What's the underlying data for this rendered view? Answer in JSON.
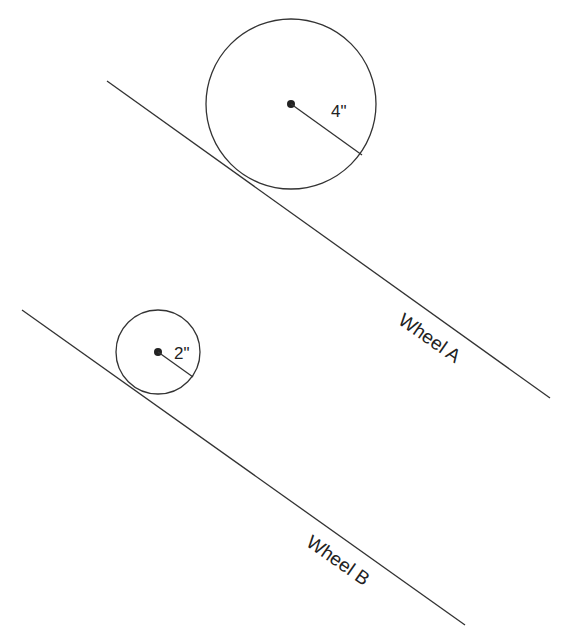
{
  "wheel_a": {
    "label": "Wheel A",
    "radius_label": "4\"",
    "center": [
      291,
      104
    ],
    "radius_px": 85,
    "incline": {
      "x1": 107,
      "y1": 81,
      "x2": 550,
      "y2": 398
    }
  },
  "wheel_b": {
    "label": "Wheel B",
    "radius_label": "2\"",
    "center": [
      158,
      352
    ],
    "radius_px": 42,
    "incline": {
      "x1": 22,
      "y1": 310,
      "x2": 465,
      "y2": 625
    }
  },
  "colors": {
    "stroke": "#333333",
    "text": "#222222"
  }
}
